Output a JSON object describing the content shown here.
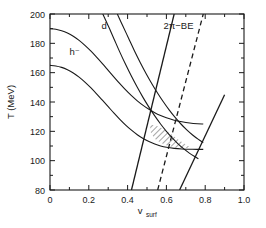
{
  "chart_data": {
    "type": "line",
    "title": "",
    "xlabel": "v_surf",
    "xlabel_main": "v",
    "xlabel_sub": "surf",
    "ylabel": "T (MeV)",
    "xlim": [
      0.0,
      1.0
    ],
    "ylim": [
      80,
      200
    ],
    "xticks": [
      0.0,
      0.2,
      0.4,
      0.6,
      0.8,
      1.0
    ],
    "xticklabels": [
      "0",
      "0.2",
      "0.4",
      "0.6",
      "0.8",
      "1.0"
    ],
    "xminorticks": [
      0.1,
      0.3,
      0.5,
      0.7,
      0.9
    ],
    "yticks": [
      80,
      100,
      120,
      140,
      160,
      180,
      200
    ],
    "yticklabels": [
      "80",
      "100",
      "120",
      "140",
      "160",
      "180",
      "200"
    ],
    "yminorticks": [
      90,
      110,
      130,
      150,
      170,
      190
    ],
    "grid": false,
    "legend": "none",
    "annotations": [
      {
        "name": "h-minus-label",
        "text": "h⁻",
        "x": 0.1,
        "y": 172
      },
      {
        "name": "d-label",
        "text": "d",
        "x": 0.265,
        "y": 190
      },
      {
        "name": "two-pi-be-label",
        "text": "2π−BE",
        "x": 0.585,
        "y": 190
      }
    ],
    "series": [
      {
        "name": "h-minus-upper",
        "style": "solid",
        "points": [
          [
            0.0,
            190.0
          ],
          [
            0.03,
            189.6
          ],
          [
            0.06,
            188.6
          ],
          [
            0.09,
            187.0
          ],
          [
            0.12,
            184.8
          ],
          [
            0.15,
            182.0
          ],
          [
            0.18,
            178.6
          ],
          [
            0.21,
            174.8
          ],
          [
            0.24,
            170.6
          ],
          [
            0.27,
            166.2
          ],
          [
            0.3,
            161.6
          ],
          [
            0.33,
            157.0
          ],
          [
            0.36,
            152.5
          ],
          [
            0.39,
            148.2
          ],
          [
            0.42,
            144.3
          ],
          [
            0.45,
            140.8
          ],
          [
            0.48,
            137.7
          ],
          [
            0.51,
            135.0
          ],
          [
            0.54,
            132.7
          ],
          [
            0.57,
            130.8
          ],
          [
            0.6,
            129.2
          ],
          [
            0.64,
            127.6
          ],
          [
            0.68,
            126.5
          ],
          [
            0.72,
            125.7
          ],
          [
            0.76,
            125.2
          ],
          [
            0.79,
            125.0
          ]
        ]
      },
      {
        "name": "h-minus-lower",
        "style": "solid",
        "points": [
          [
            0.0,
            165.0
          ],
          [
            0.03,
            164.6
          ],
          [
            0.06,
            163.6
          ],
          [
            0.09,
            162.0
          ],
          [
            0.12,
            159.8
          ],
          [
            0.15,
            157.0
          ],
          [
            0.18,
            153.6
          ],
          [
            0.21,
            149.8
          ],
          [
            0.24,
            145.6
          ],
          [
            0.27,
            141.2
          ],
          [
            0.3,
            136.8
          ],
          [
            0.33,
            132.4
          ],
          [
            0.36,
            128.2
          ],
          [
            0.39,
            124.3
          ],
          [
            0.42,
            120.8
          ],
          [
            0.45,
            117.7
          ],
          [
            0.48,
            115.1
          ],
          [
            0.51,
            113.0
          ],
          [
            0.54,
            111.3
          ],
          [
            0.57,
            110.0
          ],
          [
            0.6,
            109.1
          ],
          [
            0.64,
            108.4
          ],
          [
            0.68,
            108.0
          ],
          [
            0.72,
            107.8
          ],
          [
            0.76,
            107.7
          ],
          [
            0.79,
            107.7
          ]
        ]
      },
      {
        "name": "d-left-curve",
        "style": "solid",
        "points": [
          [
            0.272,
            200.0
          ],
          [
            0.3,
            192.0
          ],
          [
            0.33,
            183.0
          ],
          [
            0.36,
            174.0
          ],
          [
            0.39,
            165.5
          ],
          [
            0.42,
            157.5
          ],
          [
            0.45,
            150.0
          ],
          [
            0.48,
            143.0
          ],
          [
            0.51,
            136.5
          ],
          [
            0.54,
            130.5
          ],
          [
            0.57,
            125.0
          ],
          [
            0.6,
            120.0
          ],
          [
            0.63,
            115.5
          ],
          [
            0.66,
            111.5
          ],
          [
            0.69,
            108.0
          ],
          [
            0.72,
            105.0
          ],
          [
            0.75,
            102.5
          ],
          [
            0.765,
            101.3
          ]
        ]
      },
      {
        "name": "d-right-curve",
        "style": "solid",
        "points": [
          [
            0.347,
            200.0
          ],
          [
            0.375,
            192.0
          ],
          [
            0.405,
            183.5
          ],
          [
            0.435,
            175.0
          ],
          [
            0.465,
            167.0
          ],
          [
            0.495,
            159.5
          ],
          [
            0.525,
            152.5
          ],
          [
            0.555,
            146.0
          ],
          [
            0.585,
            140.0
          ],
          [
            0.615,
            134.5
          ],
          [
            0.645,
            129.5
          ],
          [
            0.675,
            125.0
          ],
          [
            0.705,
            121.0
          ],
          [
            0.735,
            117.5
          ],
          [
            0.765,
            114.5
          ],
          [
            0.79,
            112.3
          ]
        ]
      },
      {
        "name": "steep-rise-left",
        "style": "solid",
        "points": [
          [
            0.42,
            80.0
          ],
          [
            0.64,
            200.0
          ]
        ]
      },
      {
        "name": "steep-rise-dashed",
        "style": "dashed",
        "points": [
          [
            0.555,
            80.0
          ],
          [
            0.79,
            200.0
          ]
        ]
      },
      {
        "name": "steep-rise-right",
        "style": "solid",
        "points": [
          [
            0.668,
            80.0
          ],
          [
            0.9,
            145.0
          ]
        ]
      }
    ],
    "hatched_region": {
      "name": "allowed-region",
      "hatch": "diagonal",
      "vertices": [
        [
          0.515,
          124.5
        ],
        [
          0.545,
          124.0
        ],
        [
          0.58,
          122.0
        ],
        [
          0.62,
          118.5
        ],
        [
          0.66,
          114.5
        ],
        [
          0.7,
          111.0
        ],
        [
          0.725,
          109.0
        ],
        [
          0.69,
          108.3
        ],
        [
          0.65,
          108.8
        ],
        [
          0.61,
          110.0
        ],
        [
          0.57,
          112.2
        ],
        [
          0.54,
          115.0
        ],
        [
          0.52,
          119.0
        ]
      ]
    }
  }
}
